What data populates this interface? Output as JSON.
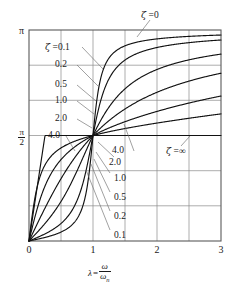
{
  "figure": {
    "name": "phase-angle-vs-frequency-ratio"
  },
  "axes": {
    "x_title_lambda": "λ",
    "x_title_equals": "=",
    "x_title_num": "ω",
    "x_title_den": "ω",
    "x_title_den_sub": "n",
    "x_ticks": [
      "0",
      "1",
      "2",
      "3"
    ],
    "y_tick_top": "π",
    "y_tick_mid_num": "π",
    "y_tick_mid_den": "2",
    "y_tick_bottom": "0"
  },
  "annotations": {
    "top": {
      "zeta": "ζ",
      "value": "=0"
    },
    "upper_left": [
      {
        "zeta": "ζ",
        "value": "=0.1"
      },
      {
        "value": "0.2"
      },
      {
        "value": "0.5"
      },
      {
        "value": "1.0"
      },
      {
        "value": "2.0"
      },
      {
        "value": "4.0"
      }
    ],
    "lower_right": [
      {
        "value": "4.0"
      },
      {
        "value": "2.0"
      },
      {
        "value": "1.0"
      },
      {
        "value": "0.5"
      },
      {
        "value": "0.2"
      },
      {
        "value": "0.1"
      }
    ],
    "infinity": {
      "zeta": "ζ",
      "value": "=∞"
    }
  },
  "colors": {
    "curve": "#121212",
    "grid": "#8a8a8a",
    "frame": "#5a5a5a",
    "leader": "#6d6d6d",
    "background": "#ffffff"
  },
  "chart_data": {
    "type": "line",
    "title": "",
    "xlabel": "λ = ω/ωn",
    "ylabel": "phase angle φ",
    "xlim": [
      0,
      3
    ],
    "ylim": [
      0,
      3.14159
    ],
    "yticks": [
      0,
      1.5708,
      3.14159
    ],
    "ytick_labels": [
      "0",
      "π/2",
      "π"
    ],
    "xticks": [
      0,
      1,
      2,
      3
    ],
    "xtick_labels": [
      "0",
      "1",
      "2",
      "3"
    ],
    "grid": true,
    "grid_x_step": 0.5,
    "grid_y_divisions": 6,
    "legend": "inline-annotations",
    "formula": "phi = arctan( 2*zeta*lambda / (1 - lambda^2) ), wrapped to [0, pi]",
    "series": [
      {
        "name": "ζ = 0.1",
        "zeta": 0.1,
        "x": [
          0,
          0.1,
          0.2,
          0.3,
          0.4,
          0.5,
          0.6,
          0.7,
          0.8,
          0.9,
          0.95,
          1.0,
          1.05,
          1.1,
          1.2,
          1.3,
          1.4,
          1.5,
          1.75,
          2.0,
          2.25,
          2.5,
          2.75,
          3.0
        ],
        "y": [
          0.0,
          0.0202,
          0.0417,
          0.0659,
          0.0952,
          0.1326,
          0.1835,
          0.2601,
          0.3948,
          0.7595,
          1.0942,
          1.5708,
          2.0639,
          2.3417,
          2.6347,
          2.7701,
          2.8464,
          2.8952,
          2.9702,
          3.0084,
          3.0316,
          3.0473,
          3.0585,
          3.0669
        ]
      },
      {
        "name": "ζ = 0.2",
        "zeta": 0.2,
        "x": [
          0,
          0.1,
          0.2,
          0.3,
          0.4,
          0.5,
          0.6,
          0.7,
          0.8,
          0.9,
          0.95,
          1.0,
          1.05,
          1.1,
          1.2,
          1.3,
          1.4,
          1.5,
          1.75,
          2.0,
          2.25,
          2.5,
          2.75,
          3.0
        ],
        "y": [
          0.0,
          0.0404,
          0.0833,
          0.1315,
          0.1895,
          0.263,
          0.3605,
          0.5002,
          0.7086,
          1.0162,
          1.209,
          1.5708,
          1.9311,
          2.149,
          2.4313,
          2.5888,
          2.6843,
          2.7468,
          2.8438,
          2.8934,
          2.9236,
          2.944,
          2.9587,
          2.9697
        ]
      },
      {
        "name": "ζ = 0.5",
        "zeta": 0.5,
        "x": [
          0,
          0.1,
          0.2,
          0.3,
          0.4,
          0.5,
          0.6,
          0.7,
          0.8,
          0.9,
          0.95,
          1.0,
          1.05,
          1.1,
          1.2,
          1.3,
          1.4,
          1.5,
          1.75,
          2.0,
          2.25,
          2.5,
          2.75,
          3.0
        ],
        "y": [
          0.0,
          0.1006,
          0.206,
          0.3217,
          0.4536,
          0.588,
          0.7529,
          0.913,
          1.0855,
          1.2793,
          1.3866,
          1.5708,
          1.7588,
          1.8925,
          2.1112,
          2.2581,
          2.361,
          2.4367,
          2.5631,
          2.6362,
          2.684,
          2.7177,
          2.7427,
          2.7621
        ]
      },
      {
        "name": "ζ = 1.0",
        "zeta": 1.0,
        "x": [
          0,
          0.1,
          0.2,
          0.3,
          0.4,
          0.5,
          0.6,
          0.7,
          0.8,
          0.9,
          0.95,
          1.0,
          1.05,
          1.1,
          1.2,
          1.3,
          1.4,
          1.5,
          1.75,
          2.0,
          2.25,
          2.5,
          2.75,
          3.0
        ],
        "y": [
          0.0,
          0.1997,
          0.4049,
          0.6174,
          0.8288,
          1.0304,
          1.212,
          1.3674,
          1.4942,
          1.5946,
          1.636,
          1.5708,
          1.7431,
          1.7674,
          1.8058,
          1.8347,
          1.8573,
          1.8755,
          1.9085,
          1.9311,
          1.9476,
          1.9601,
          1.97,
          1.978
        ]
      },
      {
        "name": "ζ = 2.0",
        "zeta": 2.0,
        "x": [
          0,
          0.1,
          0.2,
          0.3,
          0.4,
          0.5,
          0.6,
          0.7,
          0.8,
          0.9,
          0.95,
          1.0,
          1.05,
          1.1,
          1.2,
          1.3,
          1.4,
          1.5,
          1.75,
          2.0,
          2.25,
          2.5,
          2.75,
          3.0
        ],
        "y": [
          0.0,
          0.389,
          0.7086,
          0.9562,
          1.1401,
          1.2755,
          1.3757,
          1.4512,
          1.5092,
          1.5544,
          1.5736,
          1.5708,
          1.6083,
          1.6218,
          1.6452,
          1.6648,
          1.6814,
          1.6957,
          1.7235,
          1.7437,
          1.7589,
          1.7707,
          1.7801,
          1.7878
        ]
      },
      {
        "name": "ζ = 4.0",
        "zeta": 4.0,
        "x": [
          0,
          0.1,
          0.2,
          0.3,
          0.4,
          0.5,
          0.6,
          0.7,
          0.8,
          0.9,
          0.95,
          1.0,
          1.05,
          1.1,
          1.2,
          1.3,
          1.4,
          1.5,
          1.75,
          2.0,
          2.25,
          2.5,
          2.75,
          3.0
        ],
        "y": [
          0.0,
          0.6747,
          1.0122,
          1.1832,
          1.2793,
          1.3397,
          1.3812,
          1.4118,
          1.4356,
          1.4549,
          1.4633,
          1.5708,
          1.478,
          1.4847,
          1.497,
          1.508,
          1.518,
          1.5271,
          1.5467,
          1.563,
          1.5769,
          1.5888,
          1.5993,
          1.6086
        ]
      },
      {
        "name": "ζ = ∞",
        "zeta": "inf",
        "x": [
          0,
          0.25,
          0.5,
          0.75,
          1.0,
          1.25,
          1.5,
          2.0,
          2.5,
          3.0
        ],
        "y": [
          0.0,
          1.5708,
          1.5708,
          1.5708,
          1.5708,
          1.5708,
          1.5708,
          1.5708,
          1.5708,
          1.5708
        ]
      }
    ]
  }
}
